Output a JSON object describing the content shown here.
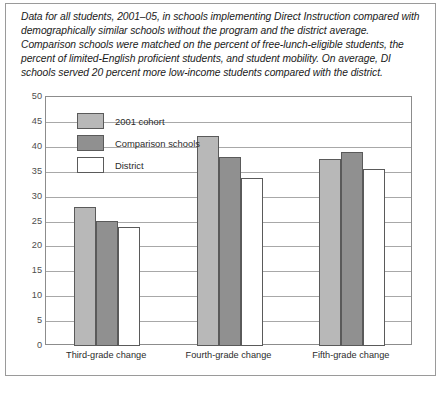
{
  "caption": "Data for all students, 2001–05, in schools implementing Direct Instruction compared with demographically similar schools without the program and the district average. Comparison schools were matched on the percent of free-lunch-eligible students, the percent of limited-English proficient students, and student mobility. On average, DI schools served 20 percent more low-income students compared with the district.",
  "colors": {
    "cohort": "#b8b8b8",
    "comparison": "#909090",
    "district": "#ffffff",
    "bar_border": "#5a5a5a",
    "grid": "#a8a8a8",
    "axis": "#8c8c8c",
    "frame": "#9a9a9a",
    "text": "#2b2b2b"
  },
  "chart_data": {
    "type": "bar",
    "title": "",
    "xlabel": "",
    "ylabel": "",
    "ylim": [
      0,
      50
    ],
    "yticks": [
      0,
      5,
      10,
      15,
      20,
      25,
      30,
      35,
      40,
      45,
      50
    ],
    "grid": true,
    "legend_position": "upper-left-inside",
    "categories": [
      "Third-grade change",
      "Fourth-grade change",
      "Fifth-grade change"
    ],
    "series": [
      {
        "name": "2001 cohort",
        "values": [
          28.0,
          42.2,
          37.6
        ]
      },
      {
        "name": "Comparison schools",
        "values": [
          25.2,
          37.9,
          39.0
        ]
      },
      {
        "name": "District",
        "values": [
          23.8,
          33.7,
          35.5
        ]
      }
    ]
  }
}
